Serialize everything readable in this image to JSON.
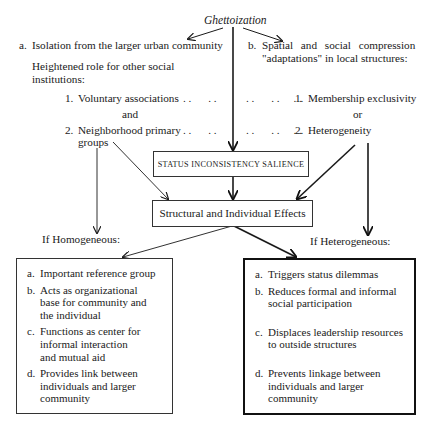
{
  "title": "Ghettoization",
  "branch_a": {
    "label": "a.",
    "text": "Isolation from the larger urban community",
    "subheading_line1": "Heightened role for other social",
    "subheading_line2": "institutions:",
    "items": [
      {
        "num": "1.",
        "text": "Voluntary associations",
        "leader": ". .      . ."
      },
      {
        "num": "2.",
        "text": "Neighborhood primary",
        "text2": "groups",
        "leader": ". .      . ."
      }
    ],
    "connector": "and"
  },
  "branch_b": {
    "label": "b.",
    "text_line1": "Spatial and social compression",
    "text_line2": "\"adaptations\" in local structures:",
    "items": [
      {
        "num": "1.",
        "text": "Membership exclusivity",
        "leader": ". .      . .     . ."
      },
      {
        "num": "2.",
        "text": "Heterogeneity",
        "leader": ". .      . .     . ."
      }
    ],
    "connector": "or"
  },
  "status_box": "STATUS INCONSISTENCY SALIENCE",
  "effects_box": "Structural and Individual Effects",
  "homogeneous": {
    "heading": "If Homogeneous:",
    "items": [
      {
        "label": "a.",
        "lines": [
          "Important reference group"
        ]
      },
      {
        "label": "b.",
        "lines": [
          "Acts as organizational",
          "base for community and",
          "the individual"
        ]
      },
      {
        "label": "c.",
        "lines": [
          "Functions as center for",
          "informal interaction",
          "and mutual aid"
        ]
      },
      {
        "label": "d.",
        "lines": [
          "Provides link between",
          "individuals and larger",
          "community"
        ]
      }
    ]
  },
  "heterogeneous": {
    "heading": "If Heterogeneous:",
    "items": [
      {
        "label": "a.",
        "lines": [
          "Triggers status dilemmas"
        ]
      },
      {
        "label": "b.",
        "lines": [
          "Reduces formal and informal",
          "social participation"
        ]
      },
      {
        "label": "c.",
        "lines": [
          "Displaces leadership resources",
          "to outside structures"
        ]
      },
      {
        "label": "d.",
        "lines": [
          "Prevents linkage between",
          "individuals and larger",
          "community"
        ]
      }
    ]
  },
  "colors": {
    "ink": "#1a1a1a",
    "background": "#ffffff"
  }
}
